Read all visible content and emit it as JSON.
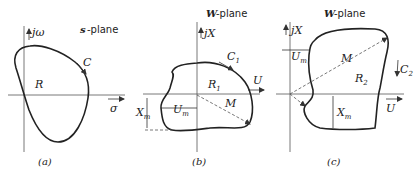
{
  "panels": [
    {
      "id": "a",
      "title_prefix": "s",
      "title_suffix": "-plane",
      "vertical_axis": "jω",
      "horizontal_axis": "σ",
      "region": "R",
      "contour": "C",
      "caption": "(a)"
    },
    {
      "id": "b",
      "title_prefix": "W",
      "title_suffix": "-plane",
      "vertical_axis": "jX",
      "horizontal_axis": "U",
      "region": "R",
      "region_sub": "1",
      "contour": "C",
      "contour_sub": "1",
      "magnitude": "M",
      "um": "U",
      "um_sub": "m",
      "xm": "X",
      "xm_sub": "m",
      "caption": "(b)"
    },
    {
      "id": "c",
      "title_prefix": "W",
      "title_suffix": "-plane",
      "vertical_axis": "jX",
      "horizontal_axis": "U",
      "region": "R",
      "region_sub": "2",
      "contour": "C",
      "contour_sub": "2",
      "magnitude": "M",
      "um": "U",
      "um_sub": "m",
      "xm": "X",
      "xm_sub": "m",
      "caption": "(c)"
    }
  ]
}
